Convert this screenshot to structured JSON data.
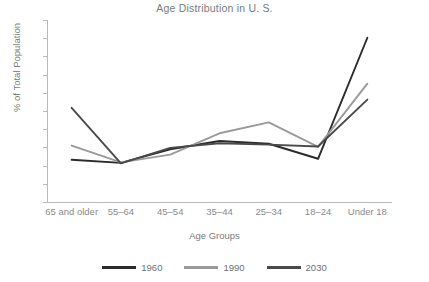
{
  "chart_data": {
    "type": "line",
    "title": "Age Distribution in U. S.",
    "xlabel": "Age Groups",
    "ylabel": "% of Total Population",
    "categories": [
      "65 and older",
      "55–64",
      "45–54",
      "35–44",
      "25–34",
      "18–24",
      "Under 18"
    ],
    "ylim": [
      0,
      40
    ],
    "yticks": [
      0,
      4,
      8,
      12,
      16,
      20,
      24,
      28,
      32,
      36,
      40
    ],
    "grid": false,
    "legend_position": "bottom",
    "series": [
      {
        "name": "1960",
        "color": "#2b2b2b",
        "values": [
          9.3,
          8.6,
          11.6,
          13.4,
          12.8,
          9.5,
          36.1
        ]
      },
      {
        "name": "1990",
        "color": "#9a9a9a",
        "values": [
          12.4,
          8.7,
          10.4,
          15.1,
          17.5,
          12.1,
          26.0
        ]
      },
      {
        "name": "2030",
        "color": "#4a4a4a",
        "values": [
          20.7,
          8.5,
          11.9,
          12.9,
          12.6,
          12.2,
          22.5
        ]
      }
    ]
  },
  "legend": {
    "items": [
      {
        "label": "1960"
      },
      {
        "label": "1990"
      },
      {
        "label": "2030"
      }
    ]
  }
}
